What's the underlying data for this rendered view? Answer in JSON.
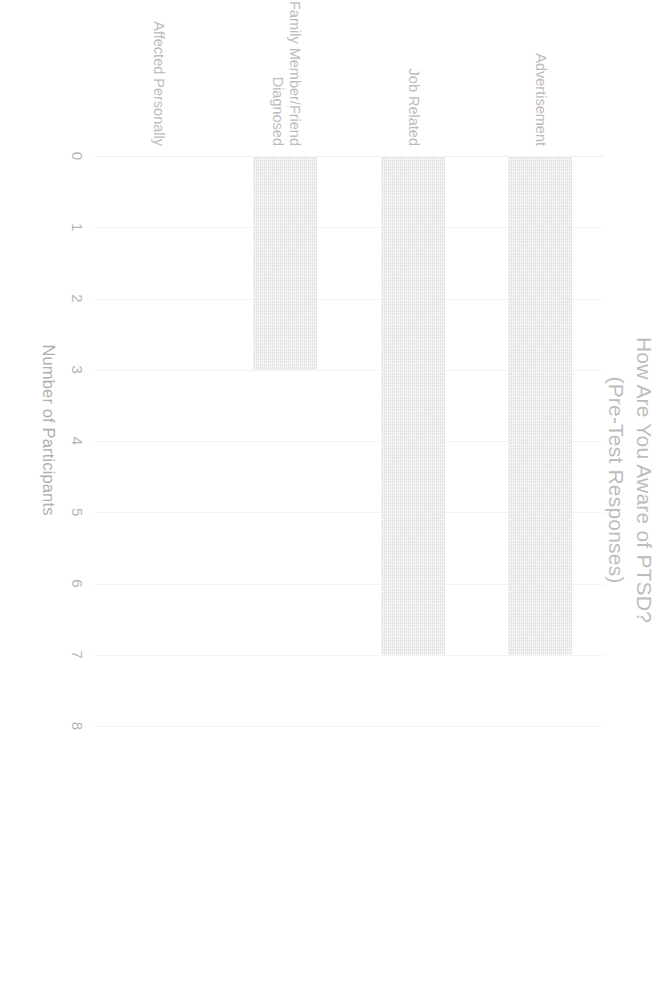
{
  "chart_data": {
    "type": "bar",
    "orientation": "horizontal",
    "title": "How Are You Aware of PTSD?",
    "subtitle": "(Pre-Test Responses)",
    "xlabel": "Number of Participants",
    "ylabel": "",
    "categories": [
      "Advertisement",
      "Job Related",
      "Family Member/Friend\nDiagnosed",
      "Affected Personally"
    ],
    "values": [
      7,
      7,
      3,
      0
    ],
    "xlim": [
      0,
      8
    ],
    "xticks": [
      "0",
      "1",
      "2",
      "3",
      "4",
      "5",
      "6",
      "7",
      "8"
    ],
    "grid": true,
    "legend": false,
    "bar_color": "#e4e4e4",
    "text_color": "#bcbcbc",
    "background": "#ffffff"
  }
}
